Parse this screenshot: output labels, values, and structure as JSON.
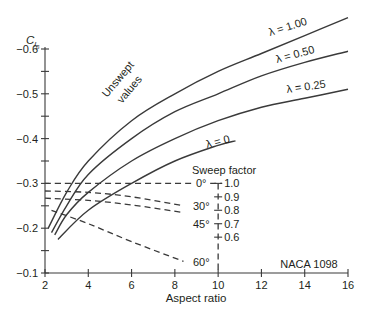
{
  "chart_data": {
    "type": "line",
    "title": "",
    "xlabel": "Aspect ratio",
    "ylabel": "C_l_β",
    "ylabel_main": "C",
    "ylabel_sub": "l",
    "ylabel_subsub": "β",
    "xlim": [
      2,
      16
    ],
    "ylim": [
      -0.1,
      -0.6
    ],
    "x_ticks": [
      2,
      4,
      6,
      8,
      10,
      12,
      14,
      16
    ],
    "x_tick_labels": [
      "2",
      "4",
      "6",
      "8",
      "10",
      "12",
      "14",
      "16"
    ],
    "y_ticks": [
      -0.1,
      -0.15,
      -0.2,
      -0.25,
      -0.3,
      -0.35,
      -0.4,
      -0.45,
      -0.5,
      -0.55,
      -0.6
    ],
    "y_tick_labels": [
      {
        "value": -0.1,
        "label": "−0.1"
      },
      {
        "value": -0.2,
        "label": "−0.2"
      },
      {
        "value": -0.3,
        "label": "−0.3"
      },
      {
        "value": -0.4,
        "label": "−0.4"
      },
      {
        "value": -0.5,
        "label": "−0.5"
      },
      {
        "value": -0.6,
        "label": "−0.6"
      }
    ],
    "grid": false,
    "series": [
      {
        "name": "λ = 1.00",
        "label": "λ = 1.00",
        "x": [
          2.15,
          3,
          4,
          6,
          8,
          10,
          12,
          14,
          16
        ],
        "y": [
          -0.2,
          -0.28,
          -0.35,
          -0.44,
          -0.5,
          -0.55,
          -0.59,
          -0.63,
          -0.67
        ]
      },
      {
        "name": "λ = 0.50",
        "label": "λ = 0.50",
        "x": [
          2.3,
          3,
          4,
          6,
          8,
          10,
          12,
          14,
          16
        ],
        "y": [
          -0.19,
          -0.25,
          -0.32,
          -0.4,
          -0.46,
          -0.5,
          -0.54,
          -0.57,
          -0.595
        ]
      },
      {
        "name": "λ = 0.25",
        "label": "λ = 0.25",
        "x": [
          2.45,
          3,
          4,
          6,
          8,
          10,
          12,
          14,
          16
        ],
        "y": [
          -0.185,
          -0.23,
          -0.28,
          -0.35,
          -0.4,
          -0.44,
          -0.47,
          -0.49,
          -0.51
        ]
      },
      {
        "name": "λ = 0",
        "label": "λ = 0",
        "x": [
          2.6,
          4,
          6,
          8,
          10,
          10.8
        ],
        "y": [
          -0.175,
          -0.24,
          -0.3,
          -0.35,
          -0.385,
          -0.395
        ]
      }
    ],
    "sweep_lines": [
      {
        "name": "0°",
        "label": "0°",
        "x": [
          2,
          6,
          8.8
        ],
        "y": [
          -0.3,
          -0.3,
          -0.3
        ]
      },
      {
        "name": "30°",
        "label": "30°",
        "x": [
          2,
          4,
          6,
          8.4
        ],
        "y": [
          -0.283,
          -0.28,
          -0.27,
          -0.25
        ]
      },
      {
        "name": "45°",
        "label": "45°",
        "x": [
          2,
          4,
          6,
          8.4
        ],
        "y": [
          -0.267,
          -0.262,
          -0.252,
          -0.235
        ]
      },
      {
        "name": "60°",
        "label": "60°",
        "x": [
          2.3,
          4,
          6,
          8.4
        ],
        "y": [
          -0.24,
          -0.21,
          -0.17,
          -0.126
        ]
      }
    ],
    "sweep_factor_axis": {
      "title": "Sweep factor",
      "ticks": [
        {
          "value": 1.0,
          "label": "1.0"
        },
        {
          "value": 0.9,
          "label": "0.9"
        },
        {
          "value": 0.8,
          "label": "0.8"
        },
        {
          "value": 0.7,
          "label": "0.7"
        },
        {
          "value": 0.6,
          "label": "0.6"
        }
      ]
    },
    "annotations": {
      "unswept_line1": "Unswept",
      "unswept_line2": "values",
      "source": "NACA 1098"
    }
  }
}
